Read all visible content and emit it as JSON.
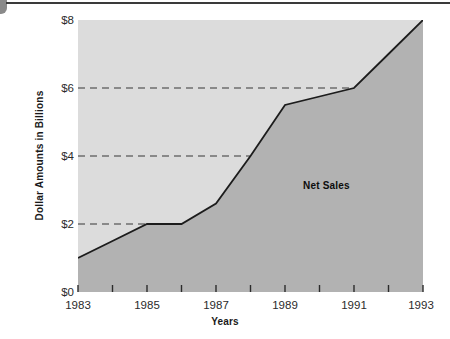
{
  "chart_data": {
    "type": "area",
    "title": "",
    "xlabel": "Years",
    "ylabel": "Dollar Amounts in Billions",
    "xlim": [
      1983,
      1993
    ],
    "ylim": [
      0,
      8
    ],
    "grid": true,
    "grid_values": [
      2,
      4,
      6
    ],
    "legend_position": "inside-plot",
    "series": [
      {
        "name": "Net Sales",
        "x": [
          1983,
          1984,
          1985,
          1986,
          1987,
          1988,
          1989,
          1990,
          1991,
          1992,
          1993
        ],
        "values": [
          1.0,
          1.5,
          2.0,
          2.0,
          2.6,
          4.0,
          5.5,
          5.75,
          6.0,
          7.0,
          8.0
        ]
      }
    ],
    "x_ticks": [
      1983,
      1984,
      1985,
      1986,
      1987,
      1988,
      1989,
      1990,
      1991,
      1992,
      1993
    ],
    "x_tick_labels": [
      "1983",
      "",
      "1985",
      "",
      "1987",
      "",
      "1989",
      "",
      "1991",
      "",
      "1993"
    ],
    "y_ticks": [
      0,
      2,
      4,
      6,
      8
    ],
    "y_tick_labels": [
      "$0",
      "$2",
      "$4",
      "$6",
      "$8"
    ],
    "annotations": [
      {
        "text": "Net Sales",
        "x": 1990.2,
        "y": 3.15
      }
    ],
    "colors": {
      "plot_background": "#dcdcdc",
      "area_fill": "#b2b2b2",
      "line": "#1c1c1c",
      "gridline": "#6e6e6e",
      "axis_text": "#2b2b2b",
      "page_background": "#ffffff"
    }
  },
  "axes": {
    "y_labels": [
      "$8",
      "$6",
      "$4",
      "$2",
      "$0"
    ],
    "x_labels": [
      "1983",
      "1985",
      "1987",
      "1989",
      "1991",
      "1993"
    ],
    "y_title": "Dollar Amounts in Billions",
    "x_title": "Years"
  }
}
